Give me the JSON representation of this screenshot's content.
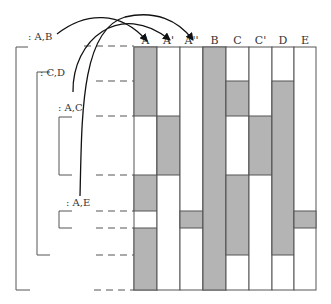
{
  "columns": [
    "A",
    "A'",
    "A''",
    "B",
    "C",
    "C'",
    "D",
    "E"
  ],
  "groups": [
    {
      "label": ": A,B"
    },
    {
      "label": ": C,D"
    },
    {
      "label": ": A,C"
    },
    {
      "label": ": A,E"
    }
  ],
  "shaded_segments": [
    {
      "column": "A",
      "rows": [
        [
          0,
          2
        ],
        [
          3,
          4
        ],
        [
          5,
          7
        ]
      ]
    },
    {
      "column": "A'",
      "rows": [
        [
          2,
          3
        ]
      ]
    },
    {
      "column": "A''",
      "rows": [
        [
          4,
          5
        ]
      ]
    },
    {
      "column": "B",
      "rows": [
        [
          0,
          7
        ]
      ]
    },
    {
      "column": "C",
      "rows": [
        [
          1,
          2
        ],
        [
          3,
          6
        ]
      ]
    },
    {
      "column": "C'",
      "rows": [
        [
          2,
          3
        ]
      ]
    },
    {
      "column": "D",
      "rows": [
        [
          1,
          6
        ]
      ]
    },
    {
      "column": "E",
      "rows": [
        [
          4,
          5
        ]
      ]
    }
  ],
  "arrows": [
    {
      "from": ": A,B",
      "to": "A"
    },
    {
      "from": ": C,D",
      "to": "A'"
    },
    {
      "from": ": A,E",
      "to": "A''"
    }
  ],
  "colors": {
    "shade": "#b4b4b4",
    "line": "#555555",
    "text": "#333333"
  }
}
